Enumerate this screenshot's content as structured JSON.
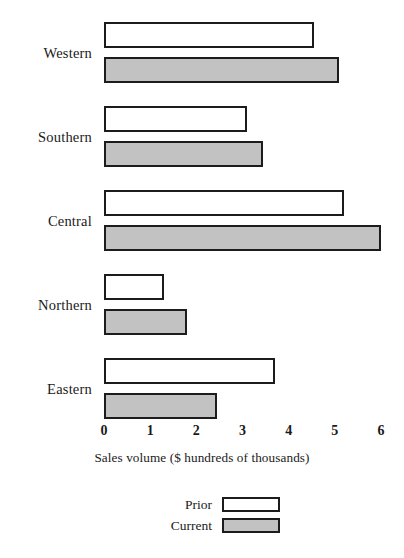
{
  "chart_data": {
    "type": "bar",
    "orientation": "horizontal",
    "title": "",
    "xlabel": "Sales volume ($ hundreds of thousands)",
    "ylabel": "",
    "xlim": [
      0,
      6
    ],
    "xticks": [
      "0",
      "1",
      "2",
      "3",
      "4",
      "5",
      "6"
    ],
    "grid": false,
    "legend_position": "bottom-center",
    "categories": [
      "Western",
      "Southern",
      "Central",
      "Northern",
      "Eastern"
    ],
    "series": [
      {
        "name": "Prior",
        "color": "#ffffff",
        "edge_color": "#1c1c1c",
        "values": [
          4.55,
          3.1,
          5.2,
          1.3,
          3.7
        ]
      },
      {
        "name": "Current",
        "color": "#c2c2c2",
        "edge_color": "#1c1c1c",
        "values": [
          5.1,
          3.45,
          6.0,
          1.8,
          2.45
        ]
      }
    ]
  },
  "axis": {
    "title": "Sales volume ($ hundreds of thousands)",
    "ticks": [
      "0",
      "1",
      "2",
      "3",
      "4",
      "5",
      "6"
    ]
  },
  "categories": [
    "Western",
    "Southern",
    "Central",
    "Northern",
    "Eastern"
  ],
  "legend": {
    "entries": [
      {
        "label": "Prior",
        "swatch": "white-swatch"
      },
      {
        "label": "Current",
        "swatch": "gray-swatch"
      }
    ]
  },
  "colors": {
    "prior_fill": "#ffffff",
    "current_fill": "#c2c2c2",
    "outline": "#1c1c1c",
    "text": "#1a1a1a",
    "background": "#ffffff"
  }
}
